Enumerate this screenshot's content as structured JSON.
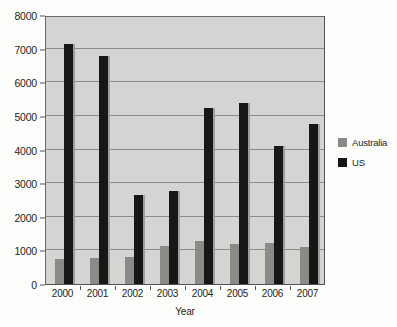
{
  "chart_data": {
    "type": "bar",
    "title": "",
    "subtitle": "",
    "xlabel": "Year",
    "ylabel": "",
    "categories": [
      "2000",
      "2001",
      "2002",
      "2003",
      "2004",
      "2005",
      "2006",
      "2007"
    ],
    "series": [
      {
        "name": "Australia",
        "color": "#8b8a87",
        "values": [
          730,
          770,
          810,
          1130,
          1280,
          1190,
          1220,
          1090
        ]
      },
      {
        "name": "US",
        "color": "#171715",
        "values": [
          7150,
          6780,
          2650,
          2780,
          5220,
          5370,
          4100,
          4750
        ]
      }
    ],
    "ylim": [
      0,
      8000
    ],
    "ytick_values": [
      0,
      1000,
      2000,
      3000,
      4000,
      5000,
      6000,
      7000,
      8000
    ],
    "ytick_labels": [
      "0",
      "1000",
      "2000",
      "3000",
      "4000",
      "5000",
      "6000",
      "7000",
      "8000"
    ],
    "grid": "horizontal",
    "legend_position": "right",
    "legend_entries": [
      "Australia",
      "US"
    ],
    "plot_background": "#d4d4d2",
    "figure_background": "#fdfdfc"
  }
}
